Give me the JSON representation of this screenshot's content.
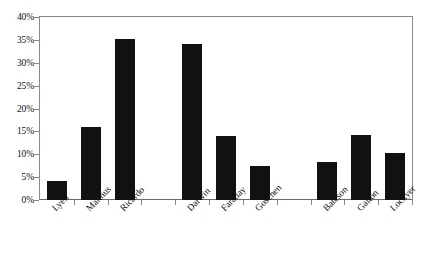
{
  "chart_data": {
    "type": "bar",
    "title": "",
    "subtitle": "",
    "xlabel": "",
    "ylabel": "",
    "categories": [
      "Lyell",
      "Malthus",
      "Ricardo",
      "",
      "Darwin",
      "Faraday",
      "Goschen",
      "",
      "Bateson",
      "Galton",
      "Lockyer"
    ],
    "values": [
      4.2,
      16.0,
      35.2,
      0,
      34.2,
      14.0,
      7.5,
      0,
      8.3,
      14.2,
      10.3
    ],
    "series": [
      {
        "name": "",
        "values": [
          4.2,
          16.0,
          35.2,
          0,
          34.2,
          14.0,
          7.5,
          0,
          8.3,
          14.2,
          10.3
        ]
      }
    ],
    "ylim": [
      0,
      40
    ],
    "ytick_values": [
      0,
      5,
      10,
      15,
      20,
      25,
      30,
      35,
      40
    ],
    "ytick_labels": [
      "0%",
      "5%",
      "10%",
      "15%",
      "20%",
      "25%",
      "30%",
      "35%",
      "40%"
    ],
    "grid": false,
    "legend": false,
    "legend_position": "none",
    "bar_color": "#111111",
    "axis_color": "#8a8a8a",
    "background_color": "#ffffff"
  }
}
